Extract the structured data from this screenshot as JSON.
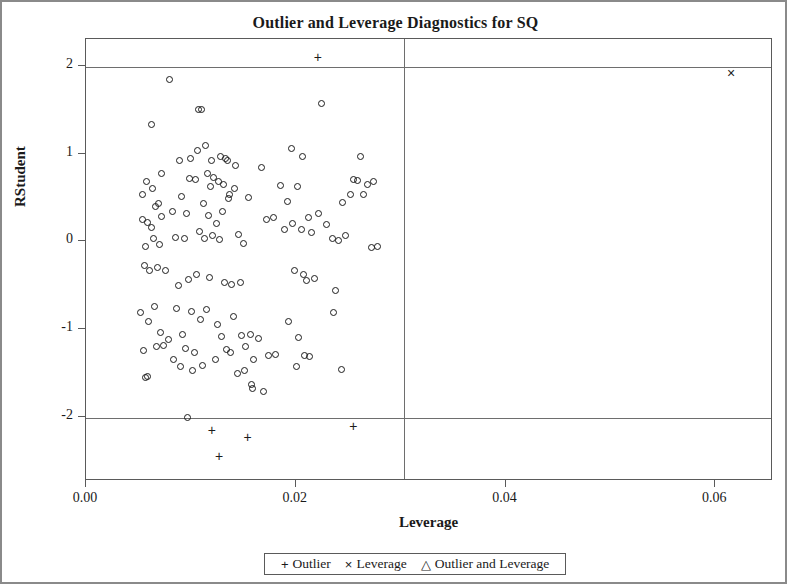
{
  "chart_data": {
    "type": "scatter",
    "title": "Outlier and Leverage Diagnostics for SQ",
    "xlabel": "Leverage",
    "ylabel": "RStudent",
    "xlim": [
      0.0,
      0.0655
    ],
    "ylim": [
      -2.72,
      2.32
    ],
    "xticks": [
      "0.00",
      "0.02",
      "0.04",
      "0.06"
    ],
    "xtick_values": [
      0.0,
      0.02,
      0.04,
      0.06
    ],
    "yticks": [
      "2",
      "1",
      "0",
      "-1",
      "-2"
    ],
    "ytick_values": [
      2,
      1,
      0,
      -1,
      -2
    ],
    "grid": false,
    "reference_lines": {
      "horizontal": [
        2,
        -2
      ],
      "vertical": [
        0.0303
      ]
    },
    "legend_position": "bottom-center",
    "series": [
      {
        "name": "Normal",
        "marker": "circle",
        "points": [
          [
            0.008,
            1.855
          ],
          [
            0.0062,
            1.345
          ],
          [
            0.0107,
            1.52
          ],
          [
            0.011,
            1.515
          ],
          [
            0.0225,
            1.59
          ],
          [
            0.0072,
            0.79
          ],
          [
            0.0063,
            0.62
          ],
          [
            0.0089,
            0.93
          ],
          [
            0.01,
            0.955
          ],
          [
            0.0106,
            1.05
          ],
          [
            0.0114,
            1.11
          ],
          [
            0.012,
            0.94
          ],
          [
            0.0128,
            0.985
          ],
          [
            0.0133,
            0.96
          ],
          [
            0.0135,
            0.93
          ],
          [
            0.0143,
            0.88
          ],
          [
            0.0196,
            1.075
          ],
          [
            0.0206,
            0.975
          ],
          [
            0.0262,
            0.985
          ],
          [
            0.0255,
            0.72
          ],
          [
            0.0259,
            0.71
          ],
          [
            0.0268,
            0.66
          ],
          [
            0.0274,
            0.7
          ],
          [
            0.0054,
            0.545
          ],
          [
            0.0058,
            0.69
          ],
          [
            0.0066,
            0.415
          ],
          [
            0.0069,
            0.44
          ],
          [
            0.0099,
            0.735
          ],
          [
            0.0104,
            0.72
          ],
          [
            0.0116,
            0.79
          ],
          [
            0.0122,
            0.745
          ],
          [
            0.0126,
            0.7
          ],
          [
            0.0119,
            0.64
          ],
          [
            0.0131,
            0.66
          ],
          [
            0.0137,
            0.545
          ],
          [
            0.0142,
            0.62
          ],
          [
            0.0167,
            0.855
          ],
          [
            0.0185,
            0.65
          ],
          [
            0.0192,
            0.47
          ],
          [
            0.0202,
            0.64
          ],
          [
            0.0245,
            0.45
          ],
          [
            0.0252,
            0.545
          ],
          [
            0.0265,
            0.545
          ],
          [
            0.0054,
            0.265
          ],
          [
            0.0059,
            0.23
          ],
          [
            0.0062,
            0.17
          ],
          [
            0.0072,
            0.295
          ],
          [
            0.0082,
            0.35
          ],
          [
            0.0091,
            0.525
          ],
          [
            0.0096,
            0.33
          ],
          [
            0.0112,
            0.44
          ],
          [
            0.0117,
            0.31
          ],
          [
            0.0124,
            0.215
          ],
          [
            0.013,
            0.355
          ],
          [
            0.0136,
            0.5
          ],
          [
            0.0155,
            0.51
          ],
          [
            0.0172,
            0.265
          ],
          [
            0.0179,
            0.29
          ],
          [
            0.0197,
            0.215
          ],
          [
            0.0205,
            0.145
          ],
          [
            0.0212,
            0.28
          ],
          [
            0.0222,
            0.335
          ],
          [
            0.0229,
            0.2
          ],
          [
            0.0247,
            0.08
          ],
          [
            0.0272,
            -0.06
          ],
          [
            0.0278,
            -0.05
          ],
          [
            0.0057,
            -0.05
          ],
          [
            0.0064,
            0.04
          ],
          [
            0.007,
            -0.02
          ],
          [
            0.0085,
            0.055
          ],
          [
            0.0094,
            0.05
          ],
          [
            0.0108,
            0.13
          ],
          [
            0.0113,
            0.045
          ],
          [
            0.0121,
            0.085
          ],
          [
            0.0127,
            0.03
          ],
          [
            0.0145,
            0.09
          ],
          [
            0.015,
            -0.015
          ],
          [
            0.0189,
            0.15
          ],
          [
            0.0215,
            0.115
          ],
          [
            0.0235,
            0.045
          ],
          [
            0.0241,
            0.02
          ],
          [
            0.0056,
            -0.265
          ],
          [
            0.0061,
            -0.315
          ],
          [
            0.0068,
            -0.28
          ],
          [
            0.0076,
            -0.32
          ],
          [
            0.0088,
            -0.49
          ],
          [
            0.0098,
            -0.425
          ],
          [
            0.0105,
            -0.37
          ],
          [
            0.0118,
            -0.4
          ],
          [
            0.0132,
            -0.455
          ],
          [
            0.0139,
            -0.475
          ],
          [
            0.0147,
            -0.455
          ],
          [
            0.0199,
            -0.325
          ],
          [
            0.0207,
            -0.365
          ],
          [
            0.021,
            -0.43
          ],
          [
            0.0218,
            -0.415
          ],
          [
            0.0238,
            -0.545
          ],
          [
            0.0052,
            -0.8
          ],
          [
            0.006,
            -0.9
          ],
          [
            0.0065,
            -0.735
          ],
          [
            0.0071,
            -1.03
          ],
          [
            0.0079,
            -1.11
          ],
          [
            0.0086,
            -0.75
          ],
          [
            0.0092,
            -1.05
          ],
          [
            0.0101,
            -0.79
          ],
          [
            0.0109,
            -0.88
          ],
          [
            0.0115,
            -0.76
          ],
          [
            0.0125,
            -0.935
          ],
          [
            0.0129,
            -1.07
          ],
          [
            0.0141,
            -0.84
          ],
          [
            0.0148,
            -1.06
          ],
          [
            0.0157,
            -1.055
          ],
          [
            0.0164,
            -1.09
          ],
          [
            0.0193,
            -0.9
          ],
          [
            0.0203,
            -1.08
          ],
          [
            0.0236,
            -0.8
          ],
          [
            0.0055,
            -1.235
          ],
          [
            0.0067,
            -1.19
          ],
          [
            0.0074,
            -1.175
          ],
          [
            0.0083,
            -1.34
          ],
          [
            0.0095,
            -1.205
          ],
          [
            0.0103,
            -1.25
          ],
          [
            0.0111,
            -1.4
          ],
          [
            0.0123,
            -1.33
          ],
          [
            0.0134,
            -1.215
          ],
          [
            0.0138,
            -1.25
          ],
          [
            0.0152,
            -1.19
          ],
          [
            0.016,
            -1.335
          ],
          [
            0.0174,
            -1.285
          ],
          [
            0.0181,
            -1.28
          ],
          [
            0.0208,
            -1.29
          ],
          [
            0.0213,
            -1.295
          ],
          [
            0.0244,
            -1.445
          ],
          [
            0.0057,
            -1.545
          ],
          [
            0.0059,
            -1.53
          ],
          [
            0.009,
            -1.415
          ],
          [
            0.0102,
            -1.465
          ],
          [
            0.0144,
            -1.49
          ],
          [
            0.0151,
            -1.46
          ],
          [
            0.0158,
            -1.62
          ],
          [
            0.0159,
            -1.665
          ],
          [
            0.0169,
            -1.7
          ],
          [
            0.0201,
            -1.42
          ],
          [
            0.0097,
            -2.0
          ]
        ]
      },
      {
        "name": "Outlier",
        "marker": "plus",
        "points": [
          [
            0.0221,
            2.115
          ],
          [
            0.012,
            -2.135
          ],
          [
            0.0154,
            -2.215
          ],
          [
            0.0255,
            -2.09
          ],
          [
            0.0127,
            -2.44
          ]
        ]
      },
      {
        "name": "Leverage",
        "marker": "x",
        "points": [
          [
            0.0615,
            1.93
          ]
        ]
      },
      {
        "name": "Outlier and Leverage",
        "marker": "triangle",
        "points": []
      }
    ]
  },
  "legend": {
    "items": [
      {
        "symbol": "+",
        "label": "Outlier"
      },
      {
        "symbol": "×",
        "label": "Leverage"
      },
      {
        "symbol": "△",
        "label": "Outlier and Leverage"
      }
    ]
  }
}
